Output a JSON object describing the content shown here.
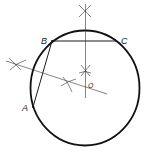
{
  "diagram": {
    "points": [
      {
        "id": "A",
        "label": "A"
      },
      {
        "id": "B",
        "label": "B"
      },
      {
        "id": "C",
        "label": "C"
      },
      {
        "id": "O",
        "label": "O"
      }
    ],
    "segments": [
      "AB",
      "BC"
    ],
    "constructions": [
      "perpendicular bisector of BC",
      "perpendicular bisector of AB",
      "circle centered at O through A, B, C"
    ],
    "stroke_color": "#111111",
    "background_color": "#ffffff"
  }
}
